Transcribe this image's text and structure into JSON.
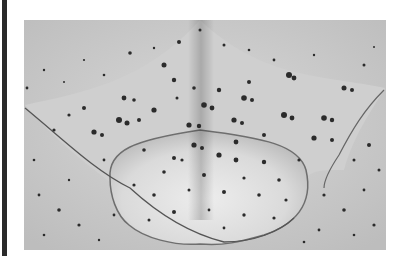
{
  "image": {
    "description": "Grayscale photograph of a flattened ray/skate-like specimen on a speckled sandy background",
    "alt": "speckled ray specimen photograph"
  },
  "colors": {
    "frame_bar": "#2a2a2a",
    "background_sand": "#c9c9c9",
    "body_light": "#e4e4e4",
    "body_shadow": "#a8a8a8",
    "speckle": "#2b2b2b",
    "page": "#ffffff"
  }
}
